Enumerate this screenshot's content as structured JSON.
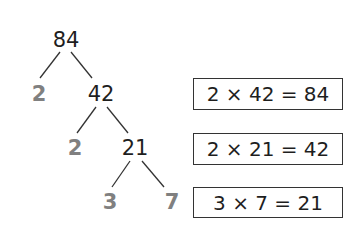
{
  "tree": {
    "root": "84",
    "level1": {
      "prime": "2",
      "composite": "42"
    },
    "level2": {
      "prime": "2",
      "composite": "21"
    },
    "level3": {
      "prime_left": "3",
      "prime_right": "7"
    }
  },
  "equations": [
    {
      "text": "2 × 42 = 84"
    },
    {
      "text": "2 × 21 = 42"
    },
    {
      "text": "3 × 7 = 21"
    }
  ],
  "colors": {
    "composite": "#1e1e1e",
    "prime": "#808080",
    "line": "#333333"
  }
}
